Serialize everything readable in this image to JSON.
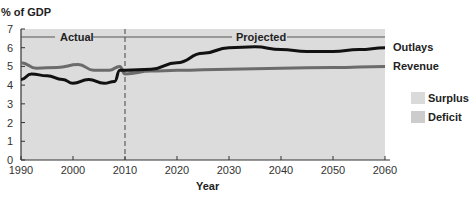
{
  "chart_data": {
    "type": "line",
    "title": "",
    "ylabel": "% of GDP",
    "xlabel": "Year",
    "xlim": [
      1990,
      2060
    ],
    "ylim": [
      0,
      7
    ],
    "x_ticks": [
      1990,
      2000,
      2010,
      2020,
      2030,
      2040,
      2050,
      2060
    ],
    "y_ticks": [
      0,
      1,
      2,
      3,
      4,
      5,
      6,
      7
    ],
    "grid": false,
    "annotations": [
      {
        "text": "Actual",
        "x_range": [
          1990,
          2010
        ]
      },
      {
        "text": "Projected",
        "x_range": [
          2010,
          2060
        ]
      },
      {
        "text": "divider",
        "x": 2010,
        "style": "dashed"
      }
    ],
    "series": [
      {
        "name": "Outlays",
        "color": "#111111",
        "x": [
          1990,
          1992,
          1995,
          1998,
          2000,
          2003,
          2006,
          2008,
          2009,
          2010,
          2015,
          2020,
          2025,
          2030,
          2035,
          2040,
          2045,
          2050,
          2055,
          2060
        ],
        "values": [
          4.3,
          4.6,
          4.5,
          4.3,
          4.1,
          4.3,
          4.1,
          4.2,
          4.8,
          4.8,
          4.85,
          5.2,
          5.7,
          6.0,
          6.05,
          5.9,
          5.8,
          5.8,
          5.9,
          6.0
        ]
      },
      {
        "name": "Revenue",
        "color": "#6b6b6b",
        "x": [
          1990,
          1993,
          1997,
          2001,
          2004,
          2007,
          2009,
          2010,
          2015,
          2020,
          2030,
          2040,
          2050,
          2060
        ],
        "values": [
          5.2,
          4.9,
          4.95,
          5.1,
          4.8,
          4.8,
          5.0,
          4.6,
          4.75,
          4.8,
          4.85,
          4.9,
          4.95,
          5.0
        ]
      }
    ],
    "legend": [
      {
        "label": "Surplus",
        "color": "#d9d9d9"
      },
      {
        "label": "Deficit",
        "color": "#cfcfcf"
      }
    ],
    "legend_position": "right"
  },
  "labels": {
    "ylabel": "% of GDP",
    "xlabel": "Year",
    "actual": "Actual",
    "projected": "Projected",
    "outlays": "Outlays",
    "revenue": "Revenue",
    "surplus": "Surplus",
    "deficit": "Deficit"
  },
  "colors": {
    "plot_bg": "#dcdcdc",
    "outlays": "#111111",
    "revenue": "#6b6b6b",
    "surplus": "#d9d9d9",
    "deficit": "#cfcfcf"
  }
}
